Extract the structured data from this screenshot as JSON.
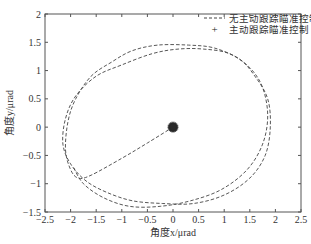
{
  "chart_data": {
    "type": "line",
    "title": "",
    "xlabel": "角度x/μrad",
    "ylabel": "角度y/μrad",
    "xlim": [
      -2.5,
      2.5
    ],
    "ylim": [
      -1.5,
      2
    ],
    "xticks": [
      -2.5,
      -2,
      -1.5,
      -1,
      -0.5,
      0,
      0.5,
      1,
      1.5,
      2,
      2.5
    ],
    "xtick_labels": [
      "-2.5",
      "-2",
      "-1.5",
      "-1",
      "-0.5",
      "0",
      "0.5",
      "1",
      "1.5",
      "2",
      "2.5"
    ],
    "yticks": [
      -1.5,
      -1,
      -0.5,
      0,
      0.5,
      1,
      1.5,
      2
    ],
    "ytick_labels": [
      "-1.5",
      "-1",
      "-0.5",
      "0",
      "0.5",
      "1",
      "1.5",
      "2"
    ],
    "grid": false,
    "legend_position": "upper right",
    "series": [
      {
        "name": "无主动跟踪瞄准控制",
        "style": "dashed",
        "color": "#444444",
        "x": [
          0,
          -0.5,
          -1.0,
          -1.6,
          -1.85,
          -2.0,
          -2.1,
          -2.05,
          -1.9,
          -1.6,
          -1.2,
          -0.8,
          -0.3,
          0.3,
          0.8,
          1.3,
          1.6,
          1.85,
          1.9,
          1.8,
          1.5,
          1.0,
          0.4,
          -0.2,
          -0.8,
          -1.3,
          -1.7,
          -2.0,
          -2.15,
          -2.1,
          -1.9,
          -1.5,
          -1.0,
          -0.4,
          0.1,
          0.6,
          1.1,
          1.5,
          1.75,
          1.85,
          1.75,
          1.45,
          0.95,
          0.35,
          -0.25,
          -0.85,
          -1.35,
          -1.75,
          -1.95
        ],
        "y": [
          0,
          -0.28,
          -0.55,
          -0.85,
          -0.9,
          -0.75,
          -0.4,
          0.1,
          0.5,
          0.9,
          1.15,
          1.35,
          1.45,
          1.45,
          1.4,
          1.2,
          0.9,
          0.5,
          0.0,
          -0.5,
          -0.9,
          -1.2,
          -1.35,
          -1.35,
          -1.3,
          -1.15,
          -0.95,
          -0.65,
          -0.3,
          0.15,
          0.55,
          0.9,
          1.1,
          1.3,
          1.38,
          1.38,
          1.3,
          1.05,
          0.7,
          0.2,
          -0.3,
          -0.75,
          -1.1,
          -1.3,
          -1.4,
          -1.4,
          -1.25,
          -1.0,
          -0.7
        ]
      },
      {
        "name": "主动跟踪瞄准控制",
        "style": "marker",
        "marker": "+",
        "color": "#222222",
        "x": [
          0.0
        ],
        "y": [
          0.0
        ],
        "note": "dense cluster of points within radius ~0.08 around origin"
      }
    ]
  },
  "legend": {
    "items": [
      {
        "label": "无主动跟踪瞄准控制",
        "symbol": "dashed-line"
      },
      {
        "label": "主动跟踪瞄准控制",
        "symbol": "plus-marker"
      }
    ]
  }
}
